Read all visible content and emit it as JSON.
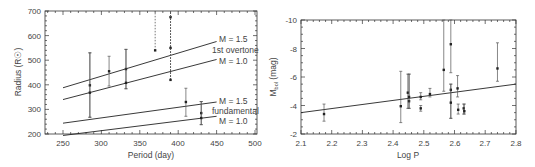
{
  "chart_data": [
    {
      "type": "scatter",
      "panel": "left",
      "title": "",
      "xlabel": "Period (day)",
      "ylabel": "Radius (R☉)",
      "xlim": [
        225,
        503
      ],
      "ylim": [
        200,
        700
      ],
      "xticks": [
        250,
        300,
        350,
        400,
        450,
        500
      ],
      "yticks": [
        200,
        300,
        400,
        500,
        600,
        700
      ],
      "grid": false,
      "lines": [
        {
          "name": "M = 1.5 1st overtone",
          "x": [
            250,
            450
          ],
          "y": [
            388,
            576
          ]
        },
        {
          "name": "M = 1.0 1st overtone",
          "x": [
            250,
            450
          ],
          "y": [
            340,
            503
          ]
        },
        {
          "name": "M = 1.5 fundamental",
          "x": [
            250,
            450
          ],
          "y": [
            244,
            330
          ]
        },
        {
          "name": "M = 1.0 fundamental",
          "x": [
            250,
            450
          ],
          "y": [
            194,
            272
          ]
        }
      ],
      "line_labels": [
        {
          "text": "M = 1.5",
          "x": 455,
          "y": 580
        },
        {
          "text": "1st overtone",
          "x": 448,
          "y": 540
        },
        {
          "text": "M = 1.0",
          "x": 455,
          "y": 503
        },
        {
          "text": "M = 1.5",
          "x": 455,
          "y": 332
        },
        {
          "text": "fundamental",
          "x": 448,
          "y": 298
        },
        {
          "text": "M = 1.0",
          "x": 455,
          "y": 270
        }
      ],
      "points": [
        {
          "x": 285,
          "y": 398,
          "ylo": 268,
          "yhi": 530,
          "style": "solid"
        },
        {
          "x": 285,
          "y": 368,
          "ylo": 268,
          "yhi": 530,
          "style": "solid"
        },
        {
          "x": 310,
          "y": 455,
          "ylo": 395,
          "yhi": 516,
          "style": "solid"
        },
        {
          "x": 332,
          "y": 464,
          "ylo": 384,
          "yhi": 544,
          "style": "solid"
        },
        {
          "x": 332,
          "y": 408,
          "ylo": 384,
          "yhi": 544,
          "style": "solid"
        },
        {
          "x": 370,
          "y": 540,
          "ylo": 540,
          "yhi": 700,
          "style": "dashed"
        },
        {
          "x": 390,
          "y": 675,
          "ylo": 420,
          "yhi": 700,
          "style": "dashed"
        },
        {
          "x": 390,
          "y": 550,
          "ylo": 420,
          "yhi": 700,
          "style": "dashed"
        },
        {
          "x": 390,
          "y": 420,
          "ylo": 420,
          "yhi": 700,
          "style": "dashed"
        },
        {
          "x": 410,
          "y": 330,
          "ylo": 272,
          "yhi": 386,
          "style": "solid"
        },
        {
          "x": 430,
          "y": 285,
          "ylo": 238,
          "yhi": 332,
          "style": "solid"
        },
        {
          "x": 430,
          "y": 265,
          "ylo": 238,
          "yhi": 332,
          "style": "solid"
        }
      ]
    },
    {
      "type": "scatter",
      "panel": "right",
      "title": "",
      "xlabel": "Log P",
      "ylabel": "M_bol (mag)",
      "xlim": [
        2.1,
        2.8
      ],
      "ylim": [
        -2,
        -10
      ],
      "xticks": [
        2.1,
        2.2,
        2.3,
        2.4,
        2.5,
        2.6,
        2.7,
        2.8
      ],
      "yticks": [
        -2,
        -4,
        -6,
        -8,
        -10
      ],
      "grid": false,
      "lines": [
        {
          "name": "fit",
          "x": [
            2.1,
            2.8
          ],
          "y": [
            -3.5,
            -5.5
          ]
        }
      ],
      "points": [
        {
          "x": 2.175,
          "y": -3.4,
          "ylo": -2.9,
          "yhi": -4.1
        },
        {
          "x": 2.425,
          "y": -3.95,
          "ylo": -2.8,
          "yhi": -6.4
        },
        {
          "x": 2.448,
          "y": -4.9,
          "ylo": -3.8,
          "yhi": -6.2
        },
        {
          "x": 2.452,
          "y": -4.3,
          "ylo": -3.8,
          "yhi": -6.2
        },
        {
          "x": 2.452,
          "y": -4.6,
          "ylo": -3.8,
          "yhi": -6.2
        },
        {
          "x": 2.49,
          "y": -4.6,
          "ylo": -4.4,
          "yhi": -4.9
        },
        {
          "x": 2.49,
          "y": -3.8,
          "ylo": -3.6,
          "yhi": -4.0
        },
        {
          "x": 2.52,
          "y": -4.8,
          "ylo": -4.6,
          "yhi": -5.2
        },
        {
          "x": 2.565,
          "y": -6.5,
          "ylo": -5.0,
          "yhi": -10
        },
        {
          "x": 2.588,
          "y": -8.3,
          "ylo": -6.3,
          "yhi": -10
        },
        {
          "x": 2.588,
          "y": -5.1,
          "ylo": -3.1,
          "yhi": -5.5
        },
        {
          "x": 2.588,
          "y": -4.2,
          "ylo": -3.1,
          "yhi": -5.5
        },
        {
          "x": 2.61,
          "y": -5.2,
          "ylo": -4.6,
          "yhi": -6.1
        },
        {
          "x": 2.612,
          "y": -3.7,
          "ylo": -3.4,
          "yhi": -4.1
        },
        {
          "x": 2.63,
          "y": -3.8,
          "ylo": -3.4,
          "yhi": -4.1
        },
        {
          "x": 2.632,
          "y": -3.6,
          "ylo": -3.4,
          "yhi": -4.1
        },
        {
          "x": 2.74,
          "y": -6.6,
          "ylo": -5.7,
          "yhi": -8.4
        }
      ]
    }
  ],
  "left": {
    "ylabel": "Radius (R☉)",
    "xlabel": "Period (day)",
    "yticks": [
      "700",
      "600",
      "500",
      "400",
      "300",
      "200"
    ],
    "xticks": [
      "250",
      "300",
      "350",
      "400",
      "450",
      "500"
    ],
    "labels": {
      "m15_overtone": "M = 1.5",
      "overtone": "1st overtone",
      "m10_overtone": "M = 1.0",
      "m15_fund": "M = 1.5",
      "fund": "fundamental",
      "m10_fund": "M = 1.0"
    }
  },
  "right": {
    "ylabel": "M",
    "ylabel_sub": "bol",
    "ylabel_unit": " (mag)",
    "xlabel": "Log P",
    "yticks": [
      "-10",
      "-8",
      "-6",
      "-4",
      "-2"
    ],
    "xticks": [
      "2.1",
      "2.2",
      "2.3",
      "2.4",
      "2.5",
      "2.6",
      "2.7",
      "2.8"
    ]
  }
}
